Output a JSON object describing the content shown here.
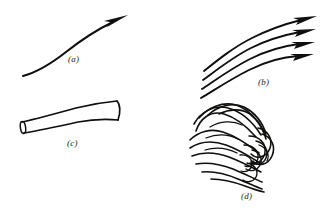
{
  "figure": {
    "width": 325,
    "height": 212,
    "background_color": "#ffffff",
    "ink_color": "#100f0d",
    "style": "hand-drawn black ink line art on white background, four unboxed panels in a 2x2 arrangement"
  },
  "panels": [
    {
      "id": "a",
      "label": "(a)",
      "position": "top-left",
      "description": "a single smooth curved arrow rising from lower left to upper right with a slender barbed arrowhead",
      "arrow_count": 1
    },
    {
      "id": "b",
      "label": "(b)",
      "position": "top-right",
      "description": "a bundle of four parallel curved arrows sweeping from lower left to upper right, each ending in a barbed arrowhead",
      "arrow_count": 4
    },
    {
      "id": "c",
      "label": "(c)",
      "position": "bottom-left",
      "description": "a gently curved streamtube drawn in outline with a small elliptical opening at the left end and a flat cap at the right end",
      "arrow_count": 0
    },
    {
      "id": "d",
      "label": "(d)",
      "position": "bottom-right",
      "description": "a turbulent fan of many curved filaments spreading to the left and converging into a tangled vortex knot at the right",
      "arrow_count": 0
    }
  ],
  "labels": {
    "a": "(a)",
    "b": "(b)",
    "c": "(c)",
    "d": "(d)"
  }
}
